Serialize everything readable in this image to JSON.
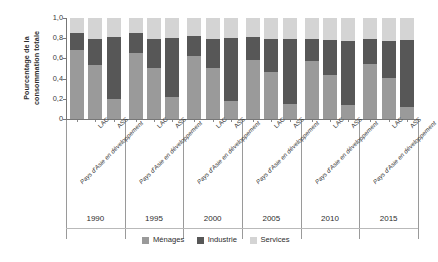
{
  "chart_data": {
    "type": "bar",
    "stacked": true,
    "title": "",
    "subtitle": "",
    "xlabel": "",
    "ylabel": "Pourcentage de la consommation totale",
    "ylim": [
      0,
      1.0
    ],
    "grid": false,
    "legend_position": "bottom",
    "ytick_labels": [
      "1,0",
      "0,8",
      "0,6",
      "0,4",
      "0,2",
      "0"
    ],
    "ytick_values": [
      1.0,
      0.8,
      0.6,
      0.4,
      0.2,
      0
    ],
    "years": [
      "1990",
      "1995",
      "2000",
      "2005",
      "2010",
      "2015"
    ],
    "regions": [
      "Pays d'Asie en développement",
      "LAC",
      "ASS"
    ],
    "legend": [
      {
        "name": "Ménages",
        "color": "#9a9a9a"
      },
      {
        "name": "Industrie",
        "color": "#575757"
      },
      {
        "name": "Services",
        "color": "#d4d4d4"
      }
    ],
    "series": [
      {
        "name": "Ménages",
        "color": "#9a9a9a",
        "values": [
          0.68,
          0.53,
          0.2,
          0.65,
          0.5,
          0.22,
          0.62,
          0.5,
          0.18,
          0.58,
          0.47,
          0.15,
          0.57,
          0.44,
          0.14,
          0.54,
          0.41,
          0.12
        ]
      },
      {
        "name": "Industrie",
        "color": "#575757",
        "values": [
          0.17,
          0.26,
          0.61,
          0.2,
          0.29,
          0.58,
          0.2,
          0.29,
          0.62,
          0.23,
          0.32,
          0.64,
          0.22,
          0.34,
          0.63,
          0.25,
          0.36,
          0.66
        ]
      },
      {
        "name": "Services",
        "color": "#d4d4d4",
        "values": [
          0.15,
          0.21,
          0.19,
          0.15,
          0.21,
          0.2,
          0.18,
          0.21,
          0.2,
          0.19,
          0.21,
          0.21,
          0.21,
          0.22,
          0.23,
          0.21,
          0.23,
          0.22
        ]
      }
    ],
    "bars": [
      {
        "year": "1990",
        "region": "Pays d'Asie en développement",
        "menages": 0.68,
        "industrie": 0.17,
        "services": 0.15
      },
      {
        "year": "1990",
        "region": "LAC",
        "menages": 0.53,
        "industrie": 0.26,
        "services": 0.21
      },
      {
        "year": "1990",
        "region": "ASS",
        "menages": 0.2,
        "industrie": 0.61,
        "services": 0.19
      },
      {
        "year": "1995",
        "region": "Pays d'Asie en développement",
        "menages": 0.65,
        "industrie": 0.2,
        "services": 0.15
      },
      {
        "year": "1995",
        "region": "LAC",
        "menages": 0.5,
        "industrie": 0.29,
        "services": 0.21
      },
      {
        "year": "1995",
        "region": "ASS",
        "menages": 0.22,
        "industrie": 0.58,
        "services": 0.2
      },
      {
        "year": "2000",
        "region": "Pays d'Asie en développement",
        "menages": 0.62,
        "industrie": 0.2,
        "services": 0.18
      },
      {
        "year": "2000",
        "region": "LAC",
        "menages": 0.5,
        "industrie": 0.29,
        "services": 0.21
      },
      {
        "year": "2000",
        "region": "ASS",
        "menages": 0.18,
        "industrie": 0.62,
        "services": 0.2
      },
      {
        "year": "2005",
        "region": "Pays d'Asie en développement",
        "menages": 0.58,
        "industrie": 0.23,
        "services": 0.19
      },
      {
        "year": "2005",
        "region": "LAC",
        "menages": 0.47,
        "industrie": 0.32,
        "services": 0.21
      },
      {
        "year": "2005",
        "region": "ASS",
        "menages": 0.15,
        "industrie": 0.64,
        "services": 0.21
      },
      {
        "year": "2010",
        "region": "Pays d'Asie en développement",
        "menages": 0.57,
        "industrie": 0.22,
        "services": 0.21
      },
      {
        "year": "2010",
        "region": "LAC",
        "menages": 0.44,
        "industrie": 0.34,
        "services": 0.22
      },
      {
        "year": "2010",
        "region": "ASS",
        "menages": 0.14,
        "industrie": 0.63,
        "services": 0.23
      },
      {
        "year": "2015",
        "region": "Pays d'Asie en développement",
        "menages": 0.54,
        "industrie": 0.25,
        "services": 0.21
      },
      {
        "year": "2015",
        "region": "LAC",
        "menages": 0.41,
        "industrie": 0.36,
        "services": 0.23
      },
      {
        "year": "2015",
        "region": "ASS",
        "menages": 0.12,
        "industrie": 0.66,
        "services": 0.22
      }
    ]
  }
}
